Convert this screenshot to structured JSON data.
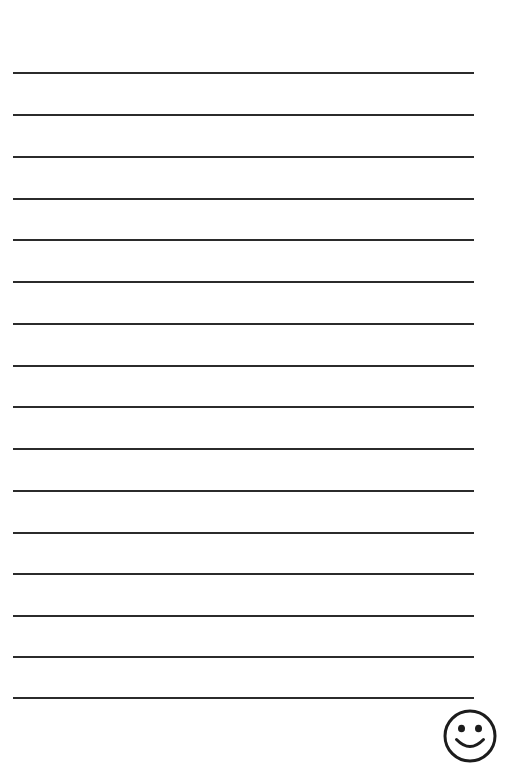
{
  "page": {
    "width_px": 505,
    "height_px": 763,
    "background_color": "#ffffff",
    "orientation": "portrait",
    "content_text": ""
  },
  "ruling": {
    "label": "ruled-lines",
    "line_color": "#2b2b2b",
    "line_thickness_px": 2,
    "line_count": 16,
    "line_left_px": 13,
    "line_right_px": 474,
    "line_width_px": 461,
    "line_spacing_px": 41.7,
    "first_line_y_px": 73,
    "last_line_y_px": 698,
    "line_y_positions": [
      73,
      115,
      157,
      199,
      240,
      282,
      324,
      366,
      407,
      449,
      491,
      533,
      574,
      616,
      657,
      698
    ]
  },
  "smiley": {
    "label": "smiley-face",
    "description": "hand drawn smiling face",
    "stroke_color": "#1c1c1c",
    "fill_color": "#ffffff",
    "stroke_width_px": 3,
    "center_x_px": 470,
    "center_y_px": 736,
    "radius_px": 25,
    "eye_left_x_px": 461,
    "eye_right_x_px": 479,
    "eye_y_px": 728,
    "eye_radius_px": 3.4,
    "mouth_label": "smile-arc"
  }
}
